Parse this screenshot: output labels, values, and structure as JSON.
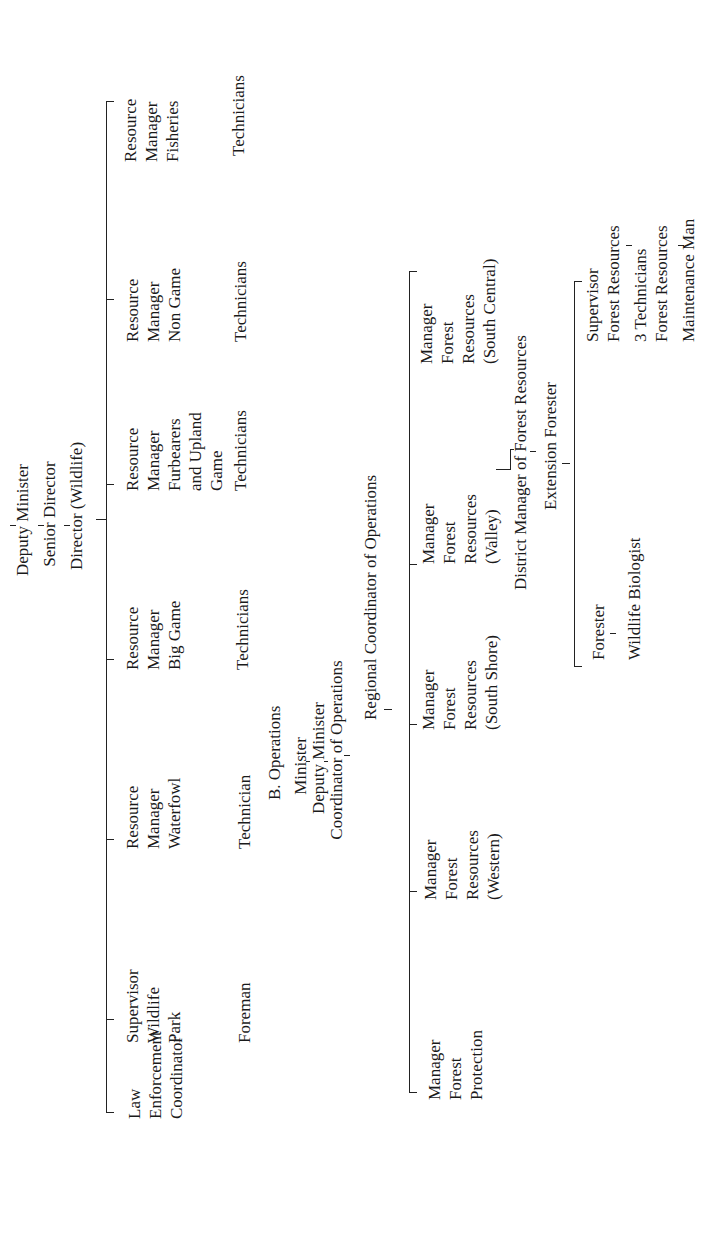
{
  "wildlife": {
    "head": {
      "line1": "Deputy Minister",
      "line2": "Senior Director",
      "line3": "Director (Wildlife)"
    },
    "children": [
      {
        "lines": [
          "Law",
          "Enforcement",
          "Coordinator"
        ],
        "sub": ""
      },
      {
        "lines": [
          "Supervisor",
          "Wildlife",
          "Park"
        ],
        "sub": "Foreman"
      },
      {
        "lines": [
          "Resource",
          "Manager",
          "Waterfowl"
        ],
        "sub": "Technician"
      },
      {
        "lines": [
          "Resource",
          "Manager",
          "Big Game"
        ],
        "sub": "Technicians"
      },
      {
        "lines": [
          "Resource",
          "Manager",
          "Furbearers",
          "and Upland",
          "Game"
        ],
        "sub": "Technicians"
      },
      {
        "lines": [
          "Resource",
          "Manager",
          "Non Game"
        ],
        "sub": "Technicians"
      },
      {
        "lines": [
          "Resource",
          "Manager",
          "Fisheries"
        ],
        "sub": "Technicians"
      }
    ]
  },
  "operations": {
    "section_label": "B. Operations",
    "head": {
      "line1": "Minister",
      "line2": "Deputy Minister",
      "line3": "Coordinator of Operations"
    },
    "regional": "Regional Coordinator of Operations",
    "managers": [
      {
        "lines": [
          "Manager",
          "Forest",
          "Protection"
        ]
      },
      {
        "lines": [
          "Manager",
          "Forest",
          "Resources",
          "(Western)"
        ]
      },
      {
        "lines": [
          "Manager",
          "Forest",
          "Resources",
          "(South Shore)"
        ]
      },
      {
        "lines": [
          "Manager",
          "Forest",
          "Resources",
          "(Valley)"
        ]
      },
      {
        "lines": [
          "Manager",
          "Forest",
          "Resources",
          "(South Central)"
        ]
      }
    ],
    "district_manager": "District Manager of Forest Resources",
    "extension_forester": "Extension Forester",
    "forester": "Forester",
    "wildlife_biologist": "Wildlife Biologist",
    "supervisor": {
      "line1": "Supervisor",
      "line2": "Forest Resources",
      "technicians": "3 Technicians",
      "technicians_line2": "Forest Resources",
      "maintenance": "Maintenance Man"
    }
  }
}
